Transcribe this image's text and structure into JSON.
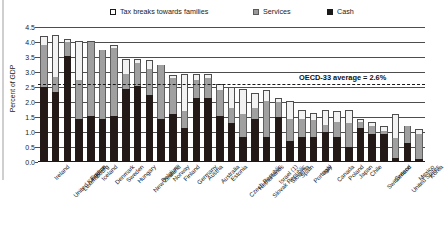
{
  "legend": {
    "items": [
      {
        "label": "Tax breaks towards families",
        "key": "tax",
        "color": "#ffffff"
      },
      {
        "label": "Services",
        "key": "services",
        "color": "#a0a0a0"
      },
      {
        "label": "Cash",
        "key": "cash",
        "color": "#231a17"
      }
    ]
  },
  "axis": {
    "ylabel": "Percent of GDP",
    "yticks": [
      "0.0",
      "0.5",
      "1.0",
      "1.5",
      "2.0",
      "2.5",
      "3.0",
      "3.5",
      "4.0",
      "4.5"
    ]
  },
  "annotation": {
    "average_label": "OECD-33 average = 2.6%",
    "average_value": 2.6
  },
  "chart_data": {
    "type": "bar",
    "title": "",
    "subtitle": "",
    "xlabel": "",
    "ylabel": "Percent of GDP",
    "ylim": [
      0,
      4.5
    ],
    "ytick_step": 0.5,
    "grid": true,
    "stacked": true,
    "legend_position": "top",
    "annotations": [
      {
        "text": "OECD-33 average = 2.6%",
        "type": "hline",
        "value": 2.6,
        "style": "dashed"
      }
    ],
    "categories": [
      "Ireland",
      "United Kingdom",
      "Luxembourg",
      "France",
      "Iceland",
      "Denmark",
      "Sweden",
      "Hungary",
      "New Zealand",
      "Belgium",
      "Norway",
      "Finland",
      "Germany",
      "Austria",
      "Australia",
      "Estonia",
      "Czech Republic",
      "Netherlands",
      "Slovak Republic",
      "Israel (1)",
      "Slovenia",
      "Spain",
      "Portugal",
      "Italy",
      "Canada",
      "Poland",
      "Japan",
      "Chile",
      "Switzerland",
      "Greece",
      "United States",
      "Mexico",
      "Korea"
    ],
    "series": [
      {
        "name": "Cash",
        "color": "#231a17",
        "values": [
          2.5,
          2.35,
          3.55,
          1.45,
          1.55,
          1.45,
          1.55,
          2.45,
          2.55,
          2.25,
          1.45,
          1.6,
          1.15,
          2.15,
          2.15,
          1.55,
          1.3,
          0.85,
          1.45,
          0.85,
          1.5,
          0.7,
          0.85,
          0.85,
          1.0,
          0.85,
          0.5,
          1.15,
          0.95,
          0.95,
          0.15,
          0.65,
          0.1
        ]
      },
      {
        "name": "Services",
        "color": "#a0a0a0",
        "values": [
          1.4,
          0.5,
          0.45,
          1.3,
          2.45,
          2.3,
          2.25,
          0.5,
          0.75,
          0.85,
          1.8,
          1.2,
          0.55,
          0.6,
          0.65,
          0.85,
          0.5,
          0.75,
          0.35,
          1.2,
          0.5,
          0.75,
          0.6,
          0.55,
          0.25,
          0.5,
          0.8,
          0.2,
          0.25,
          0.1,
          0.65,
          0.55,
          0.85
        ]
      },
      {
        "name": "Tax breaks towards families",
        "color": "#f2f2f2",
        "values": [
          0.3,
          1.4,
          0.1,
          1.3,
          0.05,
          0.0,
          0.1,
          0.5,
          0.15,
          0.3,
          0.0,
          0.1,
          1.25,
          0.2,
          0.15,
          0.2,
          0.7,
          0.85,
          0.5,
          0.35,
          0.15,
          0.6,
          0.3,
          0.25,
          0.5,
          0.35,
          0.45,
          0.1,
          0.15,
          0.15,
          0.8,
          0.0,
          0.15
        ]
      }
    ]
  }
}
